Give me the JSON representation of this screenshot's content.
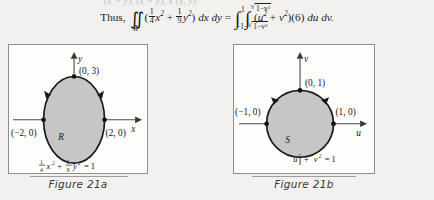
{
  "page": {
    "background": "#f2f1ef",
    "cropped_top_line": "(x + y), (x + y),        x        (x, y)"
  },
  "equation": {
    "lead": "Thus,",
    "iint_symbol": "∬",
    "region_subscript": "R",
    "open_paren": "(",
    "frac1": {
      "num": "1",
      "den": "4"
    },
    "var_x": "x",
    "exp2": "2",
    "plus": "+",
    "frac2": {
      "num": "1",
      "den": "9"
    },
    "var_y": "y",
    "close_paren": ")",
    "dxdy": "dx dy",
    "equals": "=",
    "integral_symbol": "∫",
    "outer_upper": "1",
    "outer_lower": "−1",
    "inner_upper_radicand": "1−v",
    "inner_lower_prefix": "−",
    "inner_lower_radicand": "1−v",
    "integrand_open": "(",
    "integrand_u": "u",
    "integrand_plus": "+",
    "integrand_v": "v",
    "integrand_close": ")",
    "jacobian": "(6)",
    "dudv": "du dv."
  },
  "figure_a": {
    "caption": "Figure 21a",
    "axis_x_label": "x",
    "axis_y_label": "y",
    "region_label": "R",
    "point_top": "(0, 3)",
    "point_left": "(−2, 0)",
    "point_right": "(2, 0)",
    "curve_equation": {
      "frac1": {
        "num": "1",
        "den": "4"
      },
      "var1": "x",
      "exp1": "2",
      "plus": "+",
      "frac2": {
        "num": "1",
        "den": "9"
      },
      "var2": "y",
      "exp2": "2",
      "equals": "= 1"
    },
    "fill_color": "#c6c6c6",
    "stroke_color": "#1a1a1a",
    "orientation": "counterclockwise"
  },
  "figure_b": {
    "caption": "Figure 21b",
    "axis_x_label": "u",
    "axis_y_label": "v",
    "region_label": "S",
    "point_top": "(0, 1)",
    "point_left": "(−1, 0)",
    "point_right": "(1, 0)",
    "curve_equation": {
      "var1": "u",
      "exp1": "2",
      "plus": "+",
      "var2": "v",
      "exp2": "2",
      "equals": "= 1"
    },
    "fill_color": "#c6c6c6",
    "stroke_color": "#1a1a1a",
    "orientation": "counterclockwise"
  }
}
